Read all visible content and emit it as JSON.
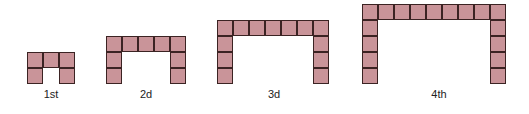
{
  "colors": {
    "tile_fill": "#c99499",
    "tile_border": "#3b2323"
  },
  "cell_size": 16,
  "figures": [
    {
      "label": "1st",
      "cols": 3,
      "rows": 2,
      "left": 27,
      "top": 52,
      "label_x": 51
    },
    {
      "label": "2d",
      "cols": 5,
      "rows": 3,
      "left": 106,
      "top": 36,
      "label_x": 146
    },
    {
      "label": "3d",
      "cols": 7,
      "rows": 4,
      "left": 217,
      "top": 20,
      "label_x": 274
    },
    {
      "label": "4th",
      "cols": 9,
      "rows": 5,
      "left": 362,
      "top": 4,
      "label_x": 439
    }
  ]
}
